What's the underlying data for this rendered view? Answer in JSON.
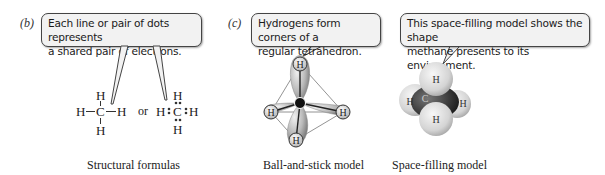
{
  "panels": [
    {
      "label": "(b)",
      "callout": [
        "Each line or pair of dots represents",
        "a shared pair of electrons."
      ],
      "caption": "Structural formulas",
      "structural_formula": {
        "center": "C",
        "top": "H",
        "bottom": "H",
        "left": "H",
        "right": "H"
      },
      "connector": "or",
      "lewis_formula": {
        "center": "C",
        "top": "H",
        "bottom": "H",
        "left": "H",
        "right": "H"
      }
    },
    {
      "label": "(c)",
      "callout": [
        "Hydrogens form corners of a",
        "regular tetrahedron."
      ],
      "caption": "Ball-and-stick model",
      "atoms": {
        "center": "C",
        "hydrogen": "H"
      }
    },
    {
      "label": "",
      "callout": [
        "This space-filling model shows the shape",
        "methane presents to its environment."
      ],
      "caption": "Space-filling model",
      "atoms": {
        "center": "C",
        "hydrogen": "H"
      }
    }
  ],
  "colors": {
    "callout_bg": "#f2f2f2",
    "callout_border": "#444444",
    "carbon": "#1a1a1a",
    "hydrogen_light": "#e8e8e8",
    "hydrogen_dark": "#9a9a9a"
  }
}
